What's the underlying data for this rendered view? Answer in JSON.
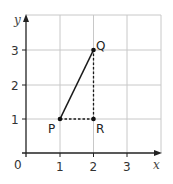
{
  "diagram": {
    "type": "coordinate-grid",
    "axes": {
      "x_label": "x",
      "y_label": "y",
      "origin_label": "0"
    },
    "x_ticks": [
      "1",
      "2",
      "3"
    ],
    "y_ticks": [
      "1",
      "2",
      "3"
    ],
    "points": [
      {
        "label": "P",
        "x": 1,
        "y": 1
      },
      {
        "label": "Q",
        "x": 2,
        "y": 3
      },
      {
        "label": "R",
        "x": 2,
        "y": 1
      }
    ],
    "segments": [
      {
        "from": "P",
        "to": "Q",
        "style": "solid"
      },
      {
        "from": "P",
        "to": "R",
        "style": "dashed"
      },
      {
        "from": "R",
        "to": "Q",
        "style": "dashed"
      }
    ],
    "colors": {
      "grid": "#c8c8c8",
      "axis": "#222222",
      "line": "#1a1a1a"
    }
  }
}
